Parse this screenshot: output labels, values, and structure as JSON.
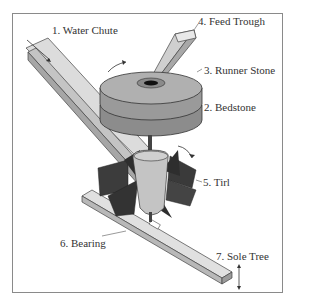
{
  "diagram": {
    "labels": [
      {
        "id": "water-chute",
        "text": "1. Water Chute"
      },
      {
        "id": "bedstone",
        "text": "2. Bedstone"
      },
      {
        "id": "runner-stone",
        "text": "3. Runner Stone"
      },
      {
        "id": "feed-trough",
        "text": "4. Feed Trough"
      },
      {
        "id": "tirl",
        "text": "5. Tirl"
      },
      {
        "id": "bearing",
        "text": "6. Bearing"
      },
      {
        "id": "sole-tree",
        "text": "7. Sole Tree"
      }
    ],
    "colors": {
      "frame": "#8a8a8a",
      "wood_light": "#d9d9d9",
      "wood_mid": "#bdbdbd",
      "stone_top": "#a8a8a8",
      "stone_side": "#8c8c8c",
      "paddle_dark": "#3c3c3c",
      "hub": "#c4c4c4",
      "outline": "#333333"
    }
  }
}
